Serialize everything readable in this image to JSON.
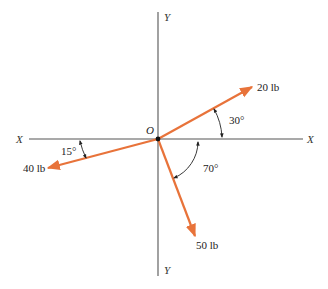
{
  "diagram": {
    "type": "force_vector_diagram",
    "origin": {
      "label": "O",
      "x": 158,
      "y": 139
    },
    "axes": {
      "x_left_label": "X",
      "x_right_label": "X",
      "y_top_label": "Y",
      "y_bottom_label": "Y"
    },
    "forces": [
      {
        "label": "20 lb",
        "magnitude": 20,
        "unit": "lb",
        "angle_label": "30°",
        "angle_from_x_deg": 30,
        "direction": "up-right"
      },
      {
        "label": "40 lb",
        "magnitude": 40,
        "unit": "lb",
        "angle_label": "15°",
        "angle_from_x_deg": 15,
        "direction": "down-left"
      },
      {
        "label": "50 lb",
        "magnitude": 50,
        "unit": "lb",
        "angle_label": "70°",
        "angle_from_x_deg": 70,
        "direction": "down-right"
      }
    ],
    "colors": {
      "force": "#E8733A",
      "axis": "#555555",
      "text": "#222222"
    }
  }
}
